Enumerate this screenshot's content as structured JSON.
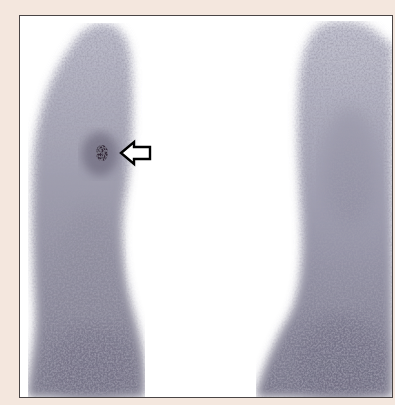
{
  "image": {
    "type": "scintigraphy-scan",
    "description": "Grayscale nuclear medicine scan showing two elongated limb-like uptake regions with a focal hot spot indicated by an arrow",
    "colors": {
      "background": "#f4e7de",
      "frame_border": "#4a4545",
      "scan_field": "#ffffff",
      "uptake_light": "#b9b9c8",
      "uptake_mid": "#8d8c9c",
      "uptake_dark": "#5e5a6c",
      "hotspot": "#2a1f2e",
      "arrow": "#000000"
    },
    "annotations": [
      {
        "kind": "open-arrow",
        "pointing": "left",
        "tip_x": 120,
        "tip_y": 152,
        "label": ""
      }
    ],
    "regions": [
      {
        "name": "left-limb-uptake"
      },
      {
        "name": "right-limb-uptake"
      },
      {
        "name": "focal-hotspot"
      }
    ]
  }
}
